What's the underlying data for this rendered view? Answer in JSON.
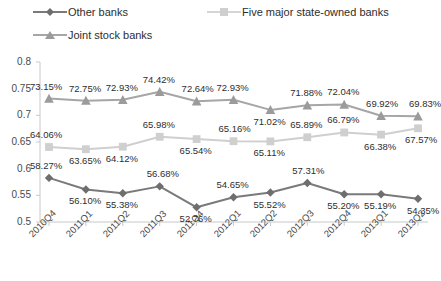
{
  "chart_data": {
    "type": "line",
    "title": "",
    "subtitle": "",
    "xlabel": "",
    "ylabel": "",
    "ylim": [
      0.5,
      0.8
    ],
    "yticks": [
      "0.5",
      "0.55",
      "0.6",
      "0.65",
      "0.7",
      "0.75",
      "0.8"
    ],
    "grid": false,
    "legend_position": "top-left",
    "categories": [
      "2010Q4",
      "2011Q1",
      "2011Q2",
      "2011Q3",
      "2011Q4",
      "2012Q1",
      "2012Q2",
      "2012Q3",
      "2012Q4",
      "2013Q1",
      "2013Q2"
    ],
    "series": [
      {
        "name": "Other banks",
        "marker": "diamond",
        "color": "#7a7a7a",
        "values": [
          58.27,
          56.1,
          55.38,
          56.68,
          52.76,
          54.65,
          55.52,
          57.31,
          55.2,
          55.19,
          54.35
        ],
        "labels": [
          "58.27%",
          "56.10%",
          "55.38%",
          "56.68%",
          "52.76%",
          "54.65%",
          "55.52%",
          "57.31%",
          "55.20%",
          "55.19%",
          "54.35%"
        ]
      },
      {
        "name": "Five major state-owned banks",
        "marker": "square",
        "color": "#cfcfcf",
        "values": [
          64.06,
          63.65,
          64.12,
          65.98,
          65.54,
          65.16,
          65.11,
          65.89,
          66.79,
          66.38,
          67.57
        ],
        "labels": [
          "64.06%",
          "63.65%",
          "64.12%",
          "65.98%",
          "65.54%",
          "65.16%",
          "65.11%",
          "65.89%",
          "66.79%",
          "66.38%",
          "67.57%"
        ]
      },
      {
        "name": "Joint stock banks",
        "marker": "triangle",
        "color": "#a6a6a6",
        "values": [
          73.15,
          72.75,
          72.93,
          74.42,
          72.64,
          72.93,
          71.02,
          71.88,
          72.04,
          69.92,
          69.83
        ],
        "labels": [
          "73.15%",
          "72.75%",
          "72.93%",
          "74.42%",
          "72.64%",
          "72.93%",
          "71.02%",
          "71.88%",
          "72.04%",
          "69.92%",
          "69.83%"
        ]
      }
    ]
  },
  "legend": {
    "items": [
      {
        "label": "Other banks",
        "marker": "diamond",
        "color": "#7a7a7a"
      },
      {
        "label": "Five major state-owned banks",
        "marker": "square",
        "color": "#cfcfcf"
      },
      {
        "label": "Joint stock banks",
        "marker": "triangle",
        "color": "#a6a6a6"
      }
    ]
  },
  "axes": {
    "y_tick_labels": [
      "0.8",
      "0.75",
      "0.7",
      "0.65",
      "0.6",
      "0.55",
      "0.5"
    ],
    "x_tick_labels": [
      "2010Q4",
      "2011Q1",
      "2011Q2",
      "2011Q3",
      "2011Q4",
      "2012Q1",
      "2012Q2",
      "2012Q3",
      "2012Q4",
      "2013Q1",
      "2013Q2"
    ]
  },
  "style": {
    "axis_color": "#c8c8c8",
    "background": "#ffffff",
    "text_color": "#2e2e2e"
  }
}
